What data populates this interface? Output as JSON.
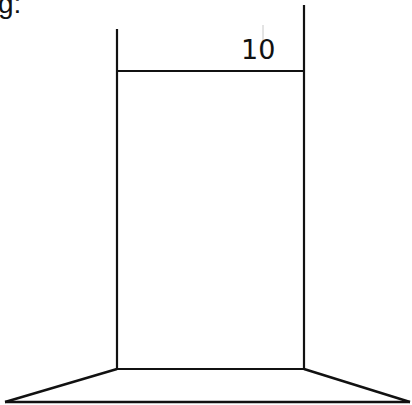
{
  "caption": {
    "text": "g:"
  },
  "diagram": {
    "type": "technical-drawing",
    "dimension": {
      "label": "10",
      "orientation": "horizontal"
    },
    "colors": {
      "stroke": "#111111",
      "background": "#ffffff",
      "guide": "#c8c8c8"
    }
  }
}
